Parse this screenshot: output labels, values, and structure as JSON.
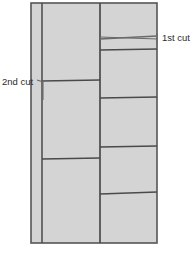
{
  "figure": {
    "background_color": "#ffffff",
    "board_fill": "#d4d4d4",
    "line_color": "#4a4a4a",
    "text_color": "#2b2b2b"
  },
  "annotations": {
    "first_cut": {
      "label": "1st cut",
      "text_x": 162,
      "text_y": 41,
      "leader_from_x": 100,
      "leader_from_y": 37,
      "leader_to_x": 158,
      "leader_to_y": 39,
      "tick_x": 157,
      "tick_top_y": 33,
      "tick_bottom_y": 45
    },
    "second_cut": {
      "label": "2nd cut",
      "text_x": 2,
      "text_y": 85,
      "leader_from_x": 37,
      "leader_from_y": 80,
      "leader_mid_x": 43,
      "leader_mid_y": 82,
      "leader_to_x": 43,
      "leader_to_y": 100
    }
  },
  "board": {
    "outline": {
      "x": 31,
      "y": 3,
      "width": 126,
      "height": 240
    },
    "vertical_dividers": [
      {
        "name": "left-strip-divider",
        "x": 42,
        "y1": 3,
        "y2": 243
      },
      {
        "name": "mid-right-divider",
        "x": 100,
        "y1": 3,
        "y2": 243
      }
    ],
    "middle_column_cuts": [
      {
        "name": "middle-cut-1",
        "x1": 42,
        "y1": 81,
        "x2": 100,
        "y2": 80
      },
      {
        "name": "middle-cut-2",
        "x1": 42,
        "y1": 159,
        "x2": 100,
        "y2": 158
      }
    ],
    "right_column_cuts": [
      {
        "name": "right-cut-1",
        "x1": 100,
        "y1": 39,
        "x2": 157,
        "y2": 36
      },
      {
        "name": "right-cut-2",
        "x1": 100,
        "y1": 50,
        "x2": 157,
        "y2": 49
      },
      {
        "name": "right-cut-3",
        "x1": 100,
        "y1": 98,
        "x2": 157,
        "y2": 97
      },
      {
        "name": "right-cut-4",
        "x1": 100,
        "y1": 147,
        "x2": 157,
        "y2": 146
      },
      {
        "name": "right-cut-5",
        "x1": 100,
        "y1": 194,
        "x2": 157,
        "y2": 192
      }
    ]
  }
}
